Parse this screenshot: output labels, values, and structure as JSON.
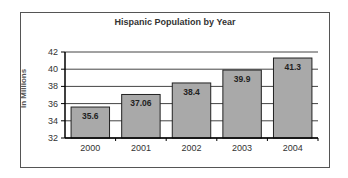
{
  "chart_data": {
    "type": "bar",
    "title": "Hispanic Population by Year",
    "xlabel": "",
    "ylabel": "In Millions",
    "categories": [
      "2000",
      "2001",
      "2002",
      "2003",
      "2004"
    ],
    "values": [
      35.6,
      37.06,
      38.4,
      39.9,
      41.3
    ],
    "data_labels": [
      "35.6",
      "37.06",
      "38.4",
      "39.9",
      "41.3"
    ],
    "ylim": [
      32,
      42
    ],
    "yticks": [
      32,
      34,
      36,
      38,
      40,
      42
    ],
    "grid": true,
    "legend": "none",
    "bar_color": "#a9a9a9"
  }
}
